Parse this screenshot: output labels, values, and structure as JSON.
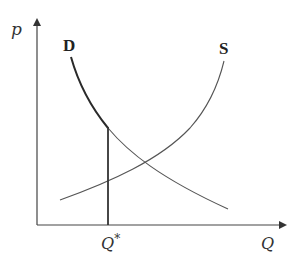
{
  "diagram": {
    "title": "",
    "type": "supply-demand",
    "axes": {
      "y_label": "p",
      "x_label": "Q"
    },
    "curves": {
      "demand_label": "D",
      "supply_label": "S"
    },
    "marker": {
      "quantity_label": "Q*",
      "quantity_base": "Q",
      "quantity_sup": "*"
    },
    "colors": {
      "axis": "#333333",
      "demand": "#2a2a2a",
      "supply": "#555555",
      "marker": "#333333"
    }
  }
}
